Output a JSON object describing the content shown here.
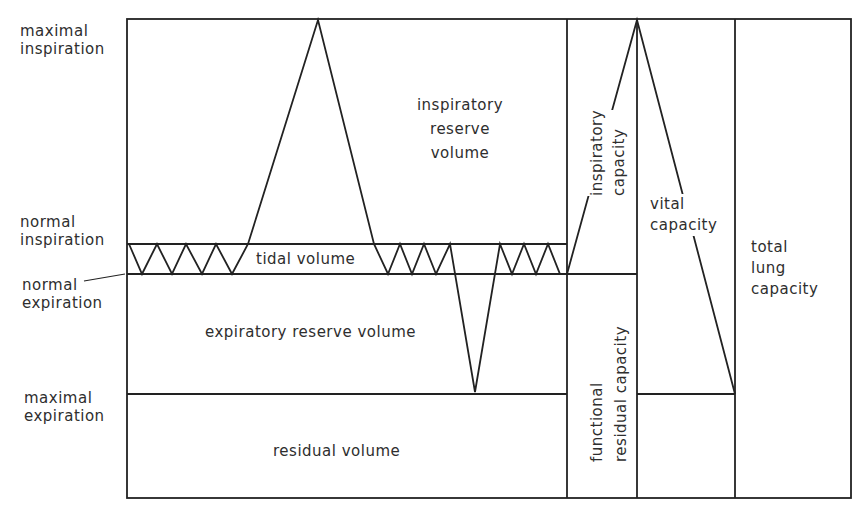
{
  "diagram": {
    "levels": {
      "maximal_inspiration": [
        "maximal",
        "inspiration"
      ],
      "normal_inspiration": [
        "normal",
        "inspiration"
      ],
      "normal_expiration": [
        "normal",
        "expiration"
      ],
      "maximal_expiration": [
        "maximal",
        "expiration"
      ]
    },
    "volumes": {
      "inspiratory_reserve_volume": [
        "inspiratory",
        "reserve",
        "volume"
      ],
      "tidal_volume": "tidal volume",
      "expiratory_reserve_volume": "expiratory reserve volume",
      "residual_volume": "residual volume"
    },
    "capacities": {
      "inspiratory_capacity": [
        "inspiratory",
        "capacity"
      ],
      "functional_residual_capacity": [
        "functional",
        "residual capacity"
      ],
      "vital_capacity": [
        "vital",
        "capacity"
      ],
      "total_lung_capacity": [
        "total",
        "lung",
        "capacity"
      ]
    },
    "colors": {
      "line": "#222222",
      "text": "#2e2e2e",
      "background": "#ffffff"
    }
  }
}
